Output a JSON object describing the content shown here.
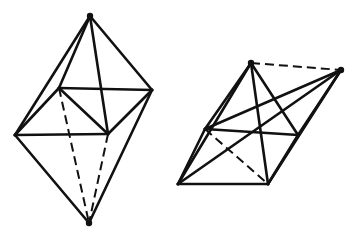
{
  "figure": {
    "kind": "line-drawing",
    "caption": "",
    "background_color": "#ffffff",
    "stroke_color": "#111111",
    "canvas": {
      "width": 357,
      "height": 246
    },
    "shapes": [
      {
        "name": "left-bipyramid",
        "label": "",
        "orientation": "upright",
        "vertices": {
          "top_apex": [
            90,
            16
          ],
          "bottom_apex": [
            89,
            223
          ],
          "left": [
            15,
            135
          ],
          "right": [
            152,
            90
          ],
          "back_upper": [
            59,
            88
          ],
          "front_lower": [
            108,
            134
          ]
        },
        "solid_edges": [
          [
            [
              90,
              16
            ],
            [
              15,
              135
            ]
          ],
          [
            [
              90,
              16
            ],
            [
              152,
              90
            ]
          ],
          [
            [
              90,
              16
            ],
            [
              59,
              88
            ]
          ],
          [
            [
              90,
              16
            ],
            [
              108,
              134
            ]
          ],
          [
            [
              15,
              135
            ],
            [
              89,
              223
            ]
          ],
          [
            [
              152,
              90
            ],
            [
              89,
              223
            ]
          ],
          [
            [
              59,
              88
            ],
            [
              152,
              90
            ]
          ],
          [
            [
              15,
              135
            ],
            [
              108,
              134
            ]
          ],
          [
            [
              59,
              88
            ],
            [
              108,
              134
            ]
          ],
          [
            [
              152,
              90
            ],
            [
              108,
              134
            ]
          ],
          [
            [
              15,
              135
            ],
            [
              59,
              88
            ]
          ]
        ],
        "hidden_edges": [
          [
            [
              59,
              88
            ],
            [
              89,
              223
            ]
          ],
          [
            [
              108,
              134
            ],
            [
              89,
              223
            ]
          ]
        ]
      },
      {
        "name": "right-bipyramid",
        "label": "",
        "orientation": "tilted",
        "vertices": {
          "top_apex": [
            251,
            63
          ],
          "right_apex": [
            341,
            70
          ],
          "left": [
            178,
            184
          ],
          "bottom_front": [
            268,
            184
          ],
          "mid_left": [
            205,
            129
          ],
          "mid_right": [
            298,
            135
          ]
        },
        "solid_edges": [
          [
            [
              251,
              63
            ],
            [
              178,
              184
            ]
          ],
          [
            [
              251,
              63
            ],
            [
              205,
              129
            ]
          ],
          [
            [
              251,
              63
            ],
            [
              268,
              184
            ]
          ],
          [
            [
              251,
              63
            ],
            [
              298,
              135
            ]
          ],
          [
            [
              341,
              70
            ],
            [
              298,
              135
            ]
          ],
          [
            [
              341,
              70
            ],
            [
              268,
              184
            ]
          ],
          [
            [
              341,
              70
            ],
            [
              205,
              129
            ]
          ],
          [
            [
              341,
              70
            ],
            [
              178,
              184
            ]
          ],
          [
            [
              178,
              184
            ],
            [
              268,
              184
            ]
          ],
          [
            [
              178,
              184
            ],
            [
              205,
              129
            ]
          ],
          [
            [
              205,
              129
            ],
            [
              298,
              135
            ]
          ],
          [
            [
              268,
              184
            ],
            [
              298,
              135
            ]
          ]
        ],
        "hidden_edges": [
          [
            [
              251,
              63
            ],
            [
              341,
              70
            ]
          ],
          [
            [
              205,
              129
            ],
            [
              268,
              184
            ]
          ]
        ]
      }
    ]
  }
}
